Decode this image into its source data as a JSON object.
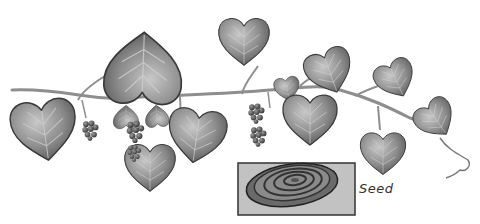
{
  "illustration": {
    "subject": "vine with heart-shaped leaves and berry clusters",
    "colors": {
      "leaf_fill": "#8a8a8a",
      "leaf_light": "#b8b8b8",
      "leaf_stroke": "#3a3a3a",
      "stem": "#9a9a9a",
      "berry": "#555555",
      "inset_bg": "#c2c2c2",
      "inset_border": "#333333",
      "seed_fill": "#7a7a7a"
    }
  },
  "inset": {
    "label": "Seed"
  }
}
